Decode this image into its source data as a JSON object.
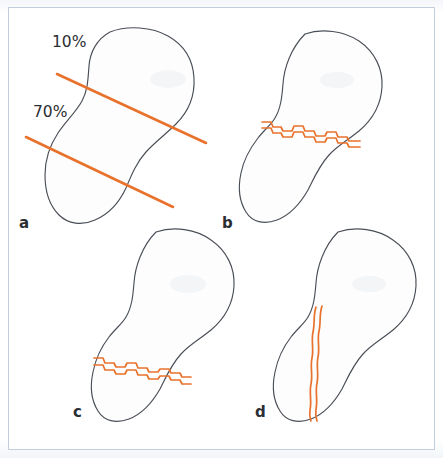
{
  "figure": {
    "background_color": "#ffffff",
    "frame_color": "#c3cedd",
    "outline_color": "#4a4f57",
    "accent_color": "#e8722c",
    "width": 443,
    "height": 458
  },
  "labels": {
    "percent_top": "10%",
    "percent_bottom": "70%"
  },
  "panels": [
    {
      "id": "a",
      "letter": "a",
      "description": "Intact bone outline with two straight orange osteotomy guide lines marking the 10% and 70% levels",
      "fracture_type": "none",
      "marker_lines": 2
    },
    {
      "id": "b",
      "letter": "b",
      "description": "Bone with jagged transverse fracture at the proximal waist level",
      "fracture_type": "transverse-proximal",
      "marker_lines": 0
    },
    {
      "id": "c",
      "letter": "c",
      "description": "Bone with jagged transverse fracture at the distal level",
      "fracture_type": "transverse-distal",
      "marker_lines": 0
    },
    {
      "id": "d",
      "letter": "d",
      "description": "Bone with wavy vertical longitudinal fracture",
      "fracture_type": "vertical-longitudinal",
      "marker_lines": 0
    }
  ]
}
